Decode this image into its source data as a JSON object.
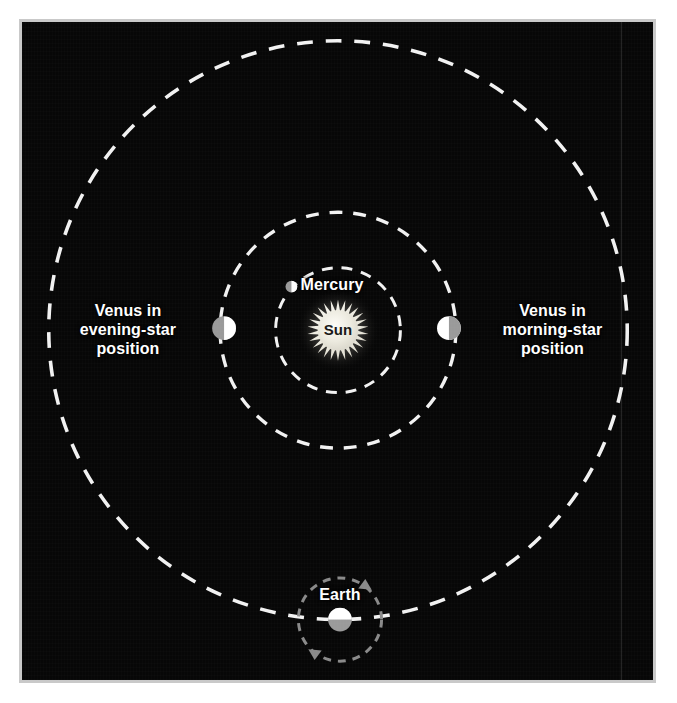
{
  "figure": {
    "kind": "astronomy-diagram",
    "background_color": "#070707",
    "frame_color": "#c9c9c9",
    "page_color": "#ffffff"
  },
  "bodies": {
    "sun": {
      "label": "Sun",
      "center_x": 338,
      "center_y": 330,
      "radius": 20,
      "corona_radius": 31,
      "color": "#e8e5dc",
      "label_color": "#1a1a1a"
    },
    "mercury": {
      "label": "Mercury",
      "center_x": 291,
      "center_y": 286,
      "radius": 6,
      "lit_color": "#ffffff",
      "dark_color": "#9a9a9a",
      "lit_side": "right"
    },
    "venus_evening": {
      "label": "Venus in\nevening-star\nposition",
      "center_x": 223,
      "center_y": 328,
      "radius": 12,
      "lit_color": "#ffffff",
      "dark_color": "#9a9a9a",
      "lit_side": "right"
    },
    "venus_morning": {
      "label": "Venus in\nmorning-star\nposition",
      "center_x": 450,
      "center_y": 328,
      "radius": 12,
      "lit_color": "#ffffff",
      "dark_color": "#9a9a9a",
      "lit_side": "left"
    },
    "earth": {
      "label": "Earth",
      "center_x": 340,
      "center_y": 622,
      "radius": 12,
      "lit_color": "#ffffff",
      "dark_color": "#9a9a9a",
      "lit_side": "top"
    }
  },
  "orbits": [
    {
      "name": "mercury-orbit",
      "center_x": 338,
      "center_y": 330,
      "radius": 63,
      "stroke": "#f2f2f2",
      "dash": "11 9",
      "width": 3
    },
    {
      "name": "venus-orbit",
      "center_x": 338,
      "center_y": 330,
      "radius": 119,
      "stroke": "#f2f2f2",
      "dash": "13 11",
      "width": 3.5
    },
    {
      "name": "earth-orbit",
      "center_x": 338,
      "center_y": 330,
      "radius": 292,
      "stroke": "#f2f2f2",
      "dash": "16 13",
      "width": 3.5
    }
  ],
  "rotation_indicator": {
    "name": "earth-rotation-circle",
    "center_x": 340,
    "center_y": 622,
    "radius": 42,
    "stroke": "#8a8a8a",
    "dash": "8 7",
    "width": 3,
    "arrow_color": "#8a8a8a",
    "arrow_upper_right": true,
    "arrow_lower_left": true
  },
  "seam": {
    "x": 627,
    "visible": true
  }
}
